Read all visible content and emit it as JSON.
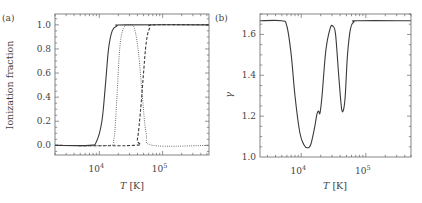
{
  "chart_data": [
    {
      "panel": "(a)",
      "type": "line",
      "title": "",
      "xlabel": "T [K]",
      "ylabel": "Ionization fraction",
      "xscale": "log",
      "xlim": [
        2000,
        540000
      ],
      "ylim": [
        -0.08,
        1.09
      ],
      "xticks": [
        {
          "value": 10000,
          "label": "10^4"
        },
        {
          "value": 100000,
          "label": "10^5"
        }
      ],
      "yticks": [
        "0.0",
        "0.2",
        "0.4",
        "0.6",
        "0.8",
        "1.0"
      ],
      "grid": false,
      "legend": null,
      "series": [
        {
          "name": "solid",
          "style": "solid",
          "x": [
            2000,
            7000,
            9000,
            11000,
            12500,
            14000,
            16000,
            19000,
            25000,
            540000
          ],
          "y": [
            0.0,
            0.0,
            0.03,
            0.2,
            0.5,
            0.8,
            0.95,
            0.99,
            1.0,
            1.0
          ]
        },
        {
          "name": "dotted",
          "style": "dotted",
          "x": [
            2000,
            14000,
            17000,
            19000,
            21000,
            24000,
            30000,
            36000,
            42000,
            48000,
            55000,
            70000,
            540000
          ],
          "y": [
            0.0,
            0.0,
            0.05,
            0.4,
            0.8,
            0.97,
            1.0,
            0.97,
            0.75,
            0.4,
            0.1,
            0.0,
            0.0
          ]
        },
        {
          "name": "dashed",
          "style": "dashed",
          "x": [
            2000,
            35000,
            40000,
            45000,
            50000,
            55000,
            62000,
            75000,
            540000
          ],
          "y": [
            0.0,
            0.0,
            0.05,
            0.3,
            0.6,
            0.85,
            0.97,
            1.0,
            1.0
          ]
        }
      ]
    },
    {
      "panel": "(b)",
      "type": "line",
      "title": "",
      "xlabel": "T [K]",
      "ylabel": "γ",
      "xscale": "log",
      "xlim": [
        2300,
        500000
      ],
      "ylim": [
        1.0,
        1.7
      ],
      "xticks": [
        {
          "value": 10000,
          "label": "10^4"
        },
        {
          "value": 100000,
          "label": "10^5"
        }
      ],
      "yticks": [
        "1.0",
        "1.2",
        "1.4",
        "1.6"
      ],
      "grid": false,
      "legend": null,
      "series": [
        {
          "name": "gamma",
          "style": "solid",
          "x": [
            2300,
            5000,
            6000,
            7000,
            8000,
            9500,
            11000,
            12500,
            14000,
            16000,
            17500,
            18500,
            19500,
            21000,
            24000,
            28000,
            31000,
            34000,
            38000,
            42000,
            45000,
            48000,
            52000,
            58000,
            65000,
            75000,
            500000
          ],
          "y": [
            1.667,
            1.667,
            1.64,
            1.5,
            1.3,
            1.12,
            1.06,
            1.045,
            1.06,
            1.14,
            1.21,
            1.225,
            1.215,
            1.3,
            1.52,
            1.63,
            1.64,
            1.6,
            1.4,
            1.24,
            1.23,
            1.3,
            1.5,
            1.63,
            1.66,
            1.667,
            1.667
          ]
        }
      ]
    }
  ],
  "panels": {
    "a": {
      "label": "(a)",
      "ylabel": "Ionization fraction",
      "xlabel_italic": "T",
      "xlabel_unit": "[K]",
      "xtick_labels": [
        {
          "base": "10",
          "exp": "4"
        },
        {
          "base": "10",
          "exp": "5"
        }
      ],
      "ytick_labels": [
        "0.0",
        "0.2",
        "0.4",
        "0.6",
        "0.8",
        "1.0"
      ]
    },
    "b": {
      "label": "(b)",
      "ylabel": "γ",
      "xlabel_italic": "T",
      "xlabel_unit": "[K]",
      "xtick_labels": [
        {
          "base": "10",
          "exp": "4"
        },
        {
          "base": "10",
          "exp": "5"
        }
      ],
      "ytick_labels": [
        "1.0",
        "1.2",
        "1.4",
        "1.6"
      ]
    }
  },
  "colors": {
    "line": "#3a3a3a",
    "axis": "#555555",
    "text": "#444444"
  }
}
